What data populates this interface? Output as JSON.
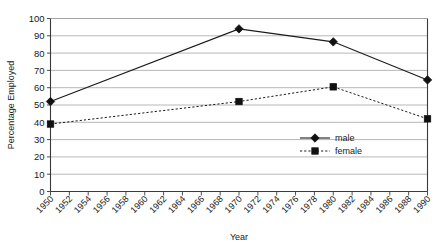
{
  "chart_data": {
    "type": "line",
    "title": "",
    "xlabel": "Year",
    "ylabel": "Percentage Employed",
    "x": [
      1950,
      1952,
      1954,
      1956,
      1958,
      1960,
      1962,
      1964,
      1966,
      1968,
      1970,
      1972,
      1974,
      1976,
      1978,
      1980,
      1982,
      1984,
      1986,
      1988,
      1990
    ],
    "categories": [
      "1950",
      "1952",
      "1954",
      "1956",
      "1958",
      "1960",
      "1962",
      "1964",
      "1966",
      "1968",
      "1970",
      "1972",
      "1974",
      "1976",
      "1978",
      "1980",
      "1982",
      "1984",
      "1986",
      "1988",
      "1990"
    ],
    "xlim": [
      1950,
      1990
    ],
    "ylim": [
      0,
      100
    ],
    "y_ticks": [
      0,
      10,
      20,
      30,
      40,
      50,
      60,
      70,
      80,
      90,
      100
    ],
    "y_tick_labels": [
      "0",
      "10",
      "20",
      "30",
      "40",
      "50",
      "60",
      "70",
      "80",
      "90",
      "100"
    ],
    "grid": "horizontal",
    "legend_position": "center-right-inside",
    "series": [
      {
        "name": "male",
        "marker": "diamond",
        "linestyle": "solid",
        "color": "#1a1a1a",
        "x": [
          1950,
          1970,
          1980,
          1990
        ],
        "values": [
          52,
          94,
          86.5,
          64.5
        ]
      },
      {
        "name": "female",
        "marker": "square",
        "linestyle": "dotted",
        "color": "#1a1a1a",
        "x": [
          1950,
          1970,
          1980,
          1990
        ],
        "values": [
          39,
          52,
          60.5,
          42
        ]
      }
    ]
  },
  "legend": {
    "items": [
      {
        "label": "male"
      },
      {
        "label": "female"
      }
    ]
  },
  "axes": {
    "x_title": "Year",
    "y_title": "Percentage Employed"
  }
}
